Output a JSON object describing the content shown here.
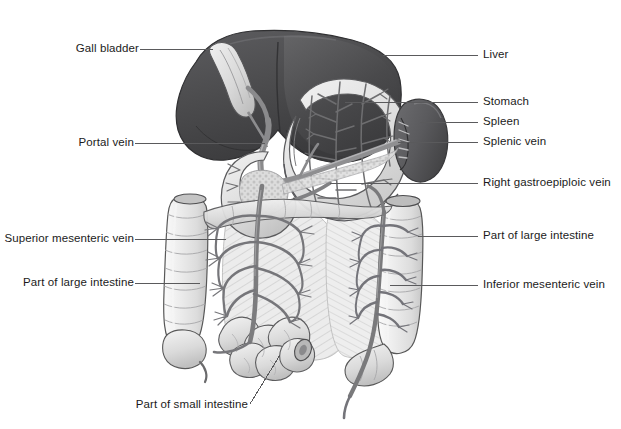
{
  "figure": {
    "background_color": "#ffffff",
    "width": 621,
    "height": 429
  },
  "palette": {
    "liver_dark": "#4e4e50",
    "liver_shadow": "#3b3b3d",
    "liver_highlight": "#636366",
    "spleen_dark": "#5d5d60",
    "organ_light": "#e8e8e8",
    "organ_mid": "#d2d2d2",
    "organ_pale": "#f2f2f2",
    "vessel_gray": "#7a7a7c",
    "vessel_dark": "#58585a",
    "outline": "#4a4a4c",
    "label_text": "#1b1b1b",
    "leader_line": "#5a5a5c"
  },
  "labels": [
    {
      "id": "gall-bladder",
      "text": "Gall bladder",
      "side": "left",
      "text_x": 88,
      "text_y": 53,
      "leader": {
        "x1": 140,
        "y1": 49,
        "x2": 213,
        "y2": 49
      }
    },
    {
      "id": "portal-vein",
      "text": "Portal vein",
      "side": "left",
      "text_x": 76,
      "text_y": 147,
      "leader": {
        "x1": 135,
        "y1": 143,
        "x2": 265,
        "y2": 143
      }
    },
    {
      "id": "superior-mesenteric-vein",
      "text": "Superior mesenteric vein",
      "side": "left",
      "text_x": 10,
      "text_y": 243,
      "leader": {
        "x1": 135,
        "y1": 239,
        "x2": 226,
        "y2": 239
      }
    },
    {
      "id": "part-of-large-intestine-left",
      "text": "Part of large intestine",
      "side": "left",
      "text_x": 25,
      "text_y": 287,
      "leader": {
        "x1": 135,
        "y1": 283,
        "x2": 200,
        "y2": 283
      }
    },
    {
      "id": "part-of-small-intestine",
      "text": "Part of small intestine",
      "side": "bottom",
      "text_x": 137,
      "text_y": 409,
      "leader": {
        "x1": 250,
        "y1": 404,
        "x2": 280,
        "y2": 355
      }
    },
    {
      "id": "liver",
      "text": "Liver",
      "side": "right",
      "text_x": 483,
      "text_y": 59,
      "leader": {
        "x1": 383,
        "y1": 55,
        "x2": 478,
        "y2": 55
      }
    },
    {
      "id": "stomach",
      "text": "Stomach",
      "side": "right",
      "text_x": 483,
      "text_y": 106,
      "leader": {
        "x1": 345,
        "y1": 102,
        "x2": 478,
        "y2": 102
      }
    },
    {
      "id": "spleen",
      "text": "Spleen",
      "side": "right",
      "text_x": 483,
      "text_y": 126,
      "leader": {
        "x1": 420,
        "y1": 122,
        "x2": 478,
        "y2": 122
      }
    },
    {
      "id": "splenic-vein",
      "text": "Splenic vein",
      "side": "right",
      "text_x": 483,
      "text_y": 146,
      "leader": {
        "x1": 398,
        "y1": 142,
        "x2": 478,
        "y2": 142
      }
    },
    {
      "id": "right-gastroepiploic-vein",
      "text": "Right gastroepiploic vein",
      "side": "right",
      "text_x": 483,
      "text_y": 187,
      "leader": {
        "x1": 330,
        "y1": 183,
        "x2": 478,
        "y2": 183
      }
    },
    {
      "id": "part-of-large-intestine-right",
      "text": "Part of large intestine",
      "side": "right",
      "text_x": 483,
      "text_y": 240,
      "leader": {
        "x1": 418,
        "y1": 236,
        "x2": 478,
        "y2": 236
      }
    },
    {
      "id": "inferior-mesenteric-vein",
      "text": "Inferior mesenteric vein",
      "side": "right",
      "text_x": 483,
      "text_y": 289,
      "leader": {
        "x1": 390,
        "y1": 285,
        "x2": 478,
        "y2": 285
      }
    }
  ],
  "structures": [
    {
      "id": "liver",
      "name": "Liver",
      "tone": "dark gray"
    },
    {
      "id": "gall-bladder",
      "name": "Gall bladder",
      "tone": "light gray"
    },
    {
      "id": "stomach",
      "name": "Stomach",
      "tone": "pale gray with vessel branches"
    },
    {
      "id": "spleen",
      "name": "Spleen",
      "tone": "dark gray bean"
    },
    {
      "id": "duodenum",
      "name": "Duodenum",
      "tone": "pale gray C-loop"
    },
    {
      "id": "pancreas",
      "name": "Pancreas",
      "tone": "stippled gray"
    },
    {
      "id": "ascending-colon",
      "name": "Ascending colon",
      "tone": "pale haustrated tube"
    },
    {
      "id": "descending-colon",
      "name": "Descending colon",
      "tone": "pale haustrated tube"
    },
    {
      "id": "transverse-colon",
      "name": "Transverse colon",
      "tone": "pale haustrated tube"
    },
    {
      "id": "small-intestine",
      "name": "Small intestine",
      "tone": "coiled pale loops"
    },
    {
      "id": "mesentery",
      "name": "Mesentery",
      "tone": "hatched fan"
    },
    {
      "id": "portal-vein",
      "name": "Portal vein",
      "tone": "gray vessel"
    },
    {
      "id": "splenic-vein",
      "name": "Splenic vein",
      "tone": "gray vessel"
    },
    {
      "id": "superior-mesenteric-vein",
      "name": "Superior mesenteric vein",
      "tone": "gray vessel"
    },
    {
      "id": "inferior-mesenteric-vein",
      "name": "Inferior mesenteric vein",
      "tone": "gray vessel"
    },
    {
      "id": "right-gastroepiploic-vein",
      "name": "Right gastroepiploic vein",
      "tone": "gray vessel"
    }
  ]
}
